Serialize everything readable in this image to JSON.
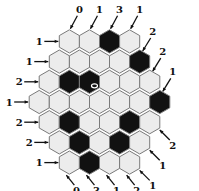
{
  "puzzle": {
    "type": "hexagonal-tomography",
    "side": 4,
    "colors": {
      "filled": "#111111",
      "empty": "#ececec",
      "border": "#7a7a7a",
      "marker": "#ffffff"
    },
    "rows": [
      [
        "W",
        "W",
        "B",
        "W"
      ],
      [
        "W",
        "W",
        "W",
        "W",
        "B"
      ],
      [
        "W",
        "B",
        "B",
        "W",
        "W",
        "W"
      ],
      [
        "W",
        "W",
        "W",
        "W",
        "W",
        "W",
        "B"
      ],
      [
        "W",
        "B",
        "W",
        "W",
        "B",
        "W"
      ],
      [
        "W",
        "B",
        "W",
        "B",
        "W"
      ],
      [
        "W",
        "B",
        "W",
        "W"
      ]
    ],
    "marker_cell": {
      "row": 2,
      "col": 2,
      "icon": "oval-marker"
    }
  },
  "clues": {
    "left": [
      "1",
      "1",
      "2",
      "1",
      "2",
      "2",
      "1"
    ],
    "top": [
      "0",
      "1",
      "3",
      "1"
    ],
    "top_right": [
      "2",
      "2",
      "1"
    ],
    "bottom_right": [
      "2",
      "1",
      "1"
    ],
    "bottom": [
      "0",
      "3",
      "1",
      "2"
    ]
  }
}
